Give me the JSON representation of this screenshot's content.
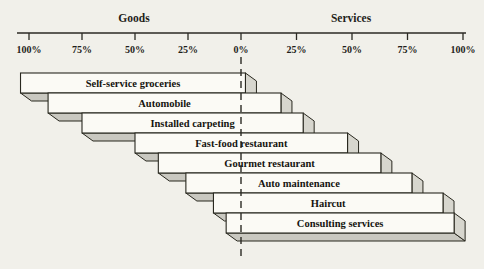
{
  "figure": {
    "background_color": "#f1f0ea",
    "ink_color": "#2b2a24",
    "bar_face_color": "#fbfaf5",
    "bar_shadow_color": "#c9c8c0",
    "bar_cap_color": "#d7d6ce"
  },
  "chart_data": {
    "type": "bar",
    "xlabel": "",
    "ylabel": "",
    "legend": "none",
    "grid": false,
    "axis": {
      "left_label": "Goods",
      "right_label": "Services",
      "tick_labels": [
        "100%",
        "75%",
        "50%",
        "25%",
        "0%",
        "25%",
        "50%",
        "75%",
        "100%"
      ],
      "tick_values": [
        -100,
        -75,
        -50,
        -25,
        0,
        25,
        50,
        75,
        100
      ],
      "zero_line_style": "dashed"
    },
    "items": [
      {
        "label": "Self-service groceries",
        "goods_extent_pct": 104,
        "services_extent_pct": 2
      },
      {
        "label": "Automobile",
        "goods_extent_pct": 91,
        "services_extent_pct": 18
      },
      {
        "label": "Installed carpeting",
        "goods_extent_pct": 75,
        "services_extent_pct": 28
      },
      {
        "label": "Fast-food restaurant",
        "goods_extent_pct": 50,
        "services_extent_pct": 48
      },
      {
        "label": "Gourmet restaurant",
        "goods_extent_pct": 39,
        "services_extent_pct": 63
      },
      {
        "label": "Auto maintenance",
        "goods_extent_pct": 26,
        "services_extent_pct": 77
      },
      {
        "label": "Haircut",
        "goods_extent_pct": 13,
        "services_extent_pct": 91
      },
      {
        "label": "Consulting services",
        "goods_extent_pct": 7,
        "services_extent_pct": 96
      }
    ]
  }
}
